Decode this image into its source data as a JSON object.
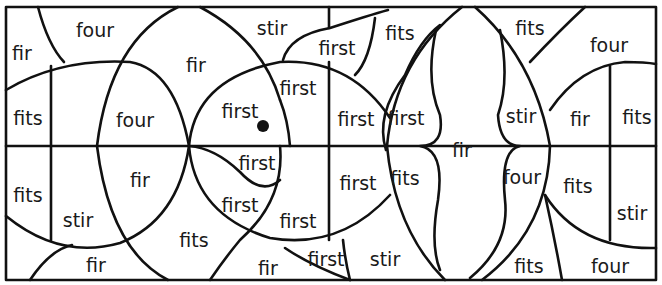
{
  "worksheet": {
    "title": "Color by word puzzle",
    "words": [
      {
        "id": "w1",
        "text": "fir"
      },
      {
        "id": "w2",
        "text": "four"
      },
      {
        "id": "w3",
        "text": "fir"
      },
      {
        "id": "w4",
        "text": "stir"
      },
      {
        "id": "w5",
        "text": "first"
      },
      {
        "id": "w6",
        "text": "fits"
      },
      {
        "id": "w7",
        "text": "fits"
      },
      {
        "id": "w8",
        "text": "four"
      },
      {
        "id": "w9",
        "text": "fits"
      },
      {
        "id": "w10",
        "text": "four"
      },
      {
        "id": "w11",
        "text": "first"
      },
      {
        "id": "w12",
        "text": "first"
      },
      {
        "id": "w13",
        "text": "first"
      },
      {
        "id": "w14",
        "text": "first"
      },
      {
        "id": "w15",
        "text": "stir"
      },
      {
        "id": "w16",
        "text": "fir"
      },
      {
        "id": "w17",
        "text": "fits"
      },
      {
        "id": "w18",
        "text": "fits"
      },
      {
        "id": "w19",
        "text": "fir"
      },
      {
        "id": "w20",
        "text": "first"
      },
      {
        "id": "w21",
        "text": "first"
      },
      {
        "id": "w22",
        "text": "first"
      },
      {
        "id": "w23",
        "text": "first"
      },
      {
        "id": "w24",
        "text": "fir"
      },
      {
        "id": "w25",
        "text": "four"
      },
      {
        "id": "w26",
        "text": "fits"
      },
      {
        "id": "w27",
        "text": "stir"
      },
      {
        "id": "w28",
        "text": "fits"
      },
      {
        "id": "w29",
        "text": "stir"
      },
      {
        "id": "w30",
        "text": "fir"
      },
      {
        "id": "w31",
        "text": "fits"
      },
      {
        "id": "w32",
        "text": "first"
      },
      {
        "id": "w33",
        "text": "stir"
      },
      {
        "id": "w34",
        "text": "fir"
      },
      {
        "id": "w35",
        "text": "fits"
      },
      {
        "id": "w36",
        "text": "four"
      }
    ]
  }
}
